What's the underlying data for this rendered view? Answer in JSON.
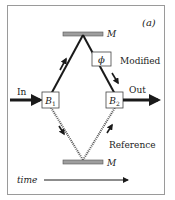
{
  "diagram": {
    "panel_label": "(a)",
    "mirror_top_label": "M",
    "mirror_bottom_label": "M",
    "phase_label": "ϕ",
    "modified_label": "Modified",
    "reference_label": "Reference",
    "input_label": "In",
    "output_label": "Out",
    "beamsplitter1": {
      "main": "B",
      "sub": "1"
    },
    "beamsplitter2": {
      "main": "B",
      "sub": "2"
    },
    "time_label": "time",
    "colors": {
      "frame": "#9a9a9a",
      "mirror_fill": "#9e9e9e",
      "mirror_stroke": "#555555",
      "beam": "#1a1a1a",
      "reference_beam": "#555555",
      "text": "#222222"
    }
  }
}
